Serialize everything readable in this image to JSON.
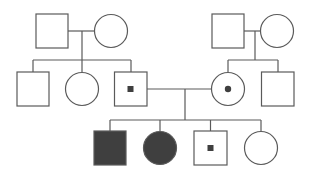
{
  "diagram": {
    "type": "pedigree",
    "stroke_color": "#5a5a5a",
    "fill_affected": "#3f3f3f",
    "fill_unaffected": "#ffffff",
    "carrier_dot_color": "#3f3f3f",
    "generations": [
      {
        "label": "I",
        "individuals": [
          {
            "id": "I-1",
            "sex": "male",
            "status": "unaffected"
          },
          {
            "id": "I-2",
            "sex": "female",
            "status": "unaffected"
          },
          {
            "id": "I-3",
            "sex": "male",
            "status": "unaffected"
          },
          {
            "id": "I-4",
            "sex": "female",
            "status": "unaffected"
          }
        ]
      },
      {
        "label": "II",
        "individuals": [
          {
            "id": "II-1",
            "sex": "male",
            "status": "unaffected"
          },
          {
            "id": "II-2",
            "sex": "female",
            "status": "unaffected"
          },
          {
            "id": "II-3",
            "sex": "male",
            "status": "carrier"
          },
          {
            "id": "II-4",
            "sex": "female",
            "status": "carrier"
          },
          {
            "id": "II-5",
            "sex": "male",
            "status": "unaffected"
          }
        ]
      },
      {
        "label": "III",
        "individuals": [
          {
            "id": "III-1",
            "sex": "male",
            "status": "affected"
          },
          {
            "id": "III-2",
            "sex": "female",
            "status": "affected"
          },
          {
            "id": "III-3",
            "sex": "male",
            "status": "carrier"
          },
          {
            "id": "III-4",
            "sex": "female",
            "status": "unaffected"
          }
        ]
      }
    ],
    "matings": [
      {
        "partners": [
          "I-1",
          "I-2"
        ],
        "children": [
          "II-1",
          "II-2",
          "II-3"
        ]
      },
      {
        "partners": [
          "I-3",
          "I-4"
        ],
        "children": [
          "II-4",
          "II-5"
        ]
      },
      {
        "partners": [
          "II-3",
          "II-4"
        ],
        "children": [
          "III-1",
          "III-2",
          "III-3",
          "III-4"
        ]
      }
    ]
  }
}
